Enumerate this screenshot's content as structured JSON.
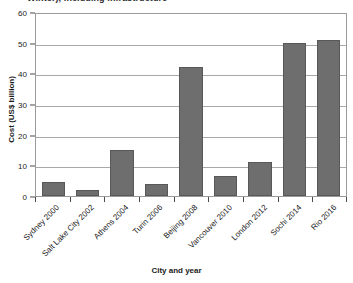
{
  "chart_data": {
    "type": "bar",
    "title": "Winter), including infrastructure",
    "xlabel": "City and year",
    "ylabel": "Cost (US$ billion)",
    "categories": [
      "Sydney 2000",
      "Salt Lake City 2002",
      "Athens 2004",
      "Turin 2006",
      "Beijing 2008",
      "Vancouver 2010",
      "London 2012",
      "Sochi 2014",
      "Rio 2016"
    ],
    "values": [
      4.5,
      2,
      15,
      4,
      42,
      6.5,
      11,
      50,
      51
    ],
    "ylim": [
      0,
      60
    ],
    "yticks": [
      0,
      10,
      20,
      30,
      40,
      50,
      60
    ],
    "ytick_labels": [
      "0",
      "10",
      "20",
      "30",
      "40",
      "50",
      "60"
    ],
    "grid": true,
    "legend": false,
    "bar_color": "#6e6e6e",
    "grid_color": "#a8a8a8",
    "axis_color": "#9a9a9a"
  }
}
